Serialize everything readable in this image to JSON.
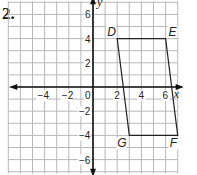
{
  "problem_number": "2.",
  "graph": {
    "x_range": [
      -7,
      7
    ],
    "y_range": [
      -7,
      7
    ],
    "x_axis_label": "x",
    "y_axis_label": "y",
    "x_tick_labels": [
      {
        "value": -4,
        "text": "−4"
      },
      {
        "value": -2,
        "text": "−2"
      },
      {
        "value": 0,
        "text": "0"
      },
      {
        "value": 2,
        "text": "2"
      },
      {
        "value": 4,
        "text": "4"
      },
      {
        "value": 6,
        "text": "6"
      }
    ],
    "y_tick_labels": [
      {
        "value": 6,
        "text": "6"
      },
      {
        "value": 4,
        "text": "4"
      },
      {
        "value": 2,
        "text": "2"
      },
      {
        "value": -2,
        "text": "−2"
      },
      {
        "value": -4,
        "text": "−4"
      },
      {
        "value": -6,
        "text": "−6"
      }
    ],
    "points": [
      {
        "name": "D",
        "x": 2,
        "y": 4
      },
      {
        "name": "E",
        "x": 6,
        "y": 4
      },
      {
        "name": "F",
        "x": 7,
        "y": -4
      },
      {
        "name": "G",
        "x": 3,
        "y": -4
      }
    ],
    "polygon": [
      "D",
      "E",
      "F",
      "G"
    ],
    "colors": {
      "grid": "#b8b8b8",
      "axis": "#111111",
      "shape": "#222222"
    }
  }
}
